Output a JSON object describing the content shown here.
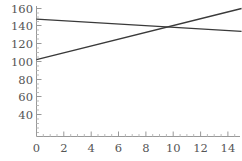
{
  "chart_data": {
    "type": "line",
    "title": "",
    "subtitle": "",
    "xlabel": "",
    "ylabel": "",
    "xlim": [
      0,
      15
    ],
    "ylim": [
      0,
      165
    ],
    "xticks": [
      0,
      2,
      4,
      6,
      8,
      10,
      12,
      14
    ],
    "yticks": [
      20,
      40,
      60,
      80,
      100,
      120,
      140,
      160
    ],
    "xtick_labels": [
      "0",
      "2",
      "4",
      "6",
      "8",
      "10",
      "12",
      "14"
    ],
    "ytick_labels": [
      "20",
      "40",
      "60",
      "80",
      "100",
      "120",
      "140",
      "160"
    ],
    "grid": false,
    "legend": false,
    "legend_position": "none",
    "x": [
      0,
      15
    ],
    "series": [
      {
        "name": "decreasing-line",
        "color": "#3a3a3a",
        "x": [
          0,
          15
        ],
        "values": [
          148,
          134
        ]
      },
      {
        "name": "increasing-line",
        "color": "#3a3a3a",
        "x": [
          0,
          15
        ],
        "values": [
          102,
          160
        ]
      }
    ],
    "annotations": [
      {
        "name": "intersection",
        "x": 10.1,
        "y": 139
      }
    ]
  },
  "axes": {
    "x_axis_name": "x-axis",
    "y_axis_name": "y-axis",
    "axis_color": "#999999",
    "tick_color": "#999999",
    "minor_tick_color": "#bbbbbb",
    "label_color": "#555555"
  },
  "canvas": {
    "background": "#ffffff",
    "width": 242,
    "height": 161
  }
}
